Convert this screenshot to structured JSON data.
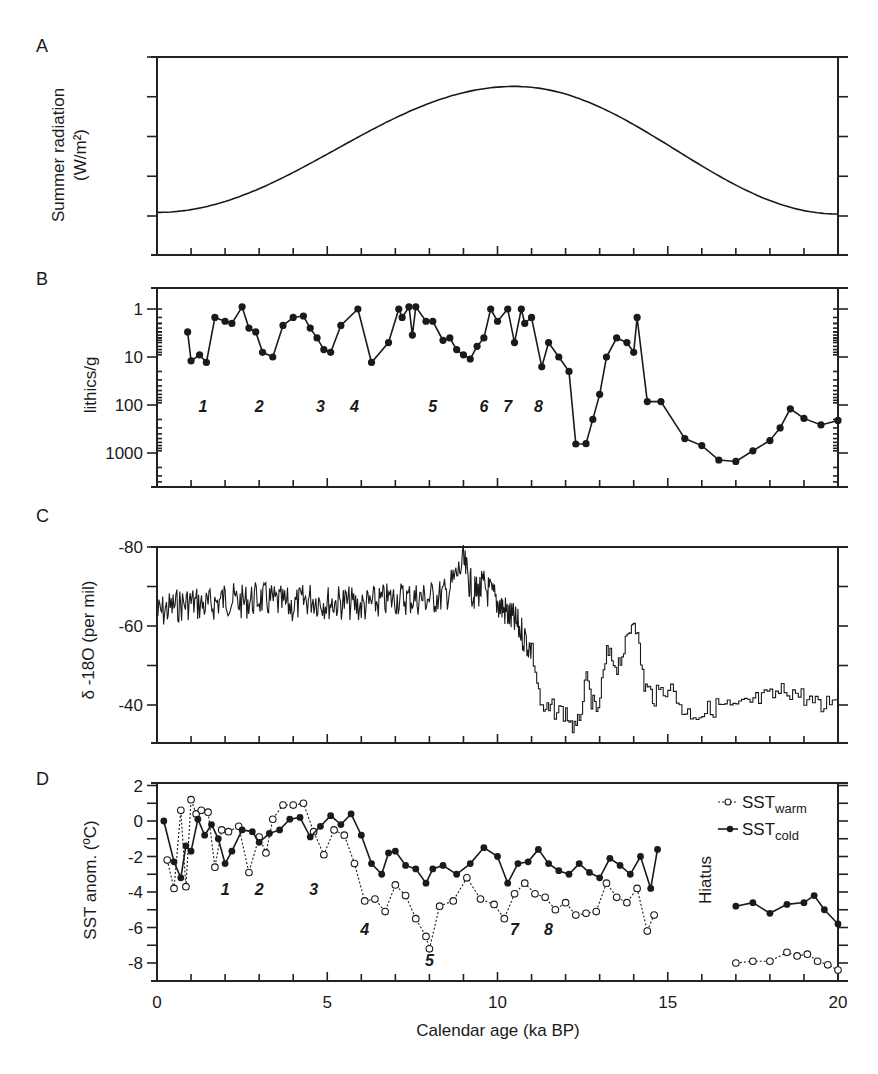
{
  "figure": {
    "xlabel": "Calendar age (ka BP)",
    "xticks": [
      "0",
      "5",
      "10",
      "15",
      "20"
    ]
  },
  "panels": {
    "A": {
      "letter": "A",
      "ylabel_line1": "Summer radiation",
      "ylabel_line2": "(W/m²)",
      "yticks": [
        "490",
        "470",
        "450"
      ]
    },
    "B": {
      "letter": "B",
      "ylabel": "lithics/g",
      "yticks": [
        "1",
        "10",
        "100",
        "1000"
      ],
      "events": [
        "1",
        "2",
        "3",
        "4",
        "5",
        "6",
        "7",
        "8"
      ]
    },
    "C": {
      "letter": "C",
      "ylabel": "δ -18O (per mil)",
      "yticks": [
        "-80",
        "-60",
        "-40"
      ]
    },
    "D": {
      "letter": "D",
      "ylabel": "SST anom. (ºC)",
      "yticks": [
        "2",
        "0",
        "-2",
        "-4",
        "-6",
        "-8"
      ],
      "events": [
        "1",
        "2",
        "3",
        "4",
        "5",
        "7",
        "8"
      ],
      "hiatus_label": "Hiatus",
      "legend": [
        {
          "name": "SST",
          "sub": "warm",
          "marker": "open-circle",
          "line": "dotted"
        },
        {
          "name": "SST",
          "sub": "cold",
          "marker": "filled-circle",
          "line": "solid"
        }
      ]
    }
  },
  "chart_data": [
    {
      "panel": "A",
      "type": "line",
      "title": "",
      "xlabel": "Calendar age (ka BP)",
      "ylabel": "Summer radiation (W/m2)",
      "xlim": [
        0,
        20
      ],
      "ylim": [
        440,
        490
      ],
      "x": [
        0,
        1,
        2,
        3,
        4,
        5,
        6,
        7,
        8,
        9,
        10,
        10.5,
        11,
        12,
        13,
        14,
        15,
        16,
        17,
        18,
        19,
        20
      ],
      "y": [
        451,
        452,
        454.5,
        458,
        462,
        466.5,
        471,
        475,
        478.5,
        481,
        482.5,
        482.6,
        482.3,
        480.5,
        477.5,
        473.5,
        469,
        464,
        459,
        454.5,
        451.5,
        450.5
      ]
    },
    {
      "panel": "B",
      "type": "line",
      "title": "",
      "ylabel": "lithics/g (log, inverted)",
      "xlim": [
        0,
        20
      ],
      "ylim": [
        3000,
        0.5
      ],
      "x": [
        0.9,
        1.0,
        1.25,
        1.45,
        1.7,
        2.0,
        2.2,
        2.5,
        2.7,
        2.9,
        3.1,
        3.4,
        3.7,
        4.0,
        4.3,
        4.5,
        4.7,
        4.9,
        5.1,
        5.4,
        5.9,
        6.3,
        6.8,
        7.1,
        7.2,
        7.4,
        7.5,
        7.6,
        7.9,
        8.1,
        8.4,
        8.6,
        8.8,
        9.0,
        9.2,
        9.4,
        9.6,
        9.8,
        10.0,
        10.3,
        10.5,
        10.7,
        10.8,
        11.0,
        11.3,
        11.5,
        11.8,
        12.1,
        12.3,
        12.6,
        12.8,
        13.0,
        13.2,
        13.5,
        13.8,
        14.0,
        14.1,
        14.4,
        14.8,
        15.5,
        16.0,
        16.5,
        17.0,
        17.5,
        18.0,
        18.3,
        18.6,
        19.0,
        19.5,
        20.0
      ],
      "y": [
        3,
        12,
        9,
        13,
        1.5,
        1.8,
        2,
        0.9,
        2.5,
        3,
        8,
        10,
        2.2,
        1.5,
        1.4,
        2.5,
        4,
        7,
        8,
        2.2,
        1,
        13,
        5,
        1,
        1.5,
        0.9,
        3.5,
        0.9,
        1.8,
        1.8,
        4.5,
        4,
        7,
        9,
        11,
        6,
        4,
        1,
        1.8,
        1,
        5,
        1,
        2,
        1.5,
        16,
        5,
        10,
        20,
        650,
        640,
        200,
        60,
        10,
        4,
        5,
        8,
        1.5,
        85,
        85,
        500,
        700,
        1400,
        1500,
        900,
        550,
        300,
        120,
        190,
        260,
        210
      ]
    },
    {
      "panel": "C",
      "type": "line",
      "title": "",
      "ylabel": "δ-18O (per mil)",
      "xlim": [
        0,
        20
      ],
      "ylim": [
        -30,
        -80
      ],
      "x": [
        0,
        0.5,
        1,
        1.5,
        2,
        2.5,
        3,
        3.5,
        4,
        4.5,
        5,
        5.5,
        6,
        6.5,
        7,
        7.5,
        8,
        8.5,
        9,
        9.3,
        9.6,
        10,
        10.3,
        10.6,
        11,
        11.3,
        11.6,
        12,
        12.3,
        12.6,
        12.9,
        13.2,
        13.5,
        13.8,
        14.0,
        14.3,
        14.6,
        15,
        15.5,
        16,
        16.5,
        17,
        17.5,
        18,
        18.5,
        19,
        19.5,
        20
      ],
      "y": [
        -63,
        -65,
        -66,
        -65,
        -67,
        -66,
        -67,
        -66,
        -65,
        -67,
        -66,
        -66,
        -65,
        -66,
        -67,
        -67,
        -67,
        -68,
        -76,
        -68,
        -70,
        -66,
        -63,
        -60,
        -54,
        -38,
        -39,
        -38,
        -33,
        -46,
        -37,
        -53,
        -50,
        -56,
        -63,
        -45,
        -42,
        -45,
        -38,
        -38,
        -40,
        -39,
        -41,
        -42,
        -44,
        -42,
        -39,
        -44
      ]
    },
    {
      "panel": "D",
      "type": "line",
      "title": "",
      "xlabel": "Calendar age (ka BP)",
      "ylabel": "SST anom. (ºC)",
      "xlim": [
        0,
        20
      ],
      "ylim": [
        -9,
        2
      ],
      "series": [
        {
          "name": "SST_cold",
          "marker": "filled",
          "x": [
            0.2,
            0.5,
            0.7,
            0.85,
            1.0,
            1.2,
            1.4,
            1.6,
            1.8,
            2.0,
            2.2,
            2.5,
            2.8,
            3.0,
            3.3,
            3.6,
            3.9,
            4.2,
            4.5,
            4.8,
            5.1,
            5.4,
            5.7,
            6.0,
            6.3,
            6.6,
            6.8,
            7.0,
            7.3,
            7.6,
            7.9,
            8.1,
            8.4,
            8.8,
            9.2,
            9.6,
            10.0,
            10.3,
            10.6,
            10.9,
            11.2,
            11.5,
            11.8,
            12.1,
            12.4,
            12.7,
            13.0,
            13.3,
            13.6,
            13.9,
            14.2,
            14.5,
            14.7,
            17.0,
            17.5,
            18.0,
            18.5,
            19.0,
            19.3,
            19.6,
            20.0
          ],
          "y": [
            0,
            -2.3,
            -3.2,
            -1.4,
            -1.7,
            0.1,
            -0.8,
            -0.2,
            -1.0,
            -2.4,
            -1.7,
            -0.5,
            -0.6,
            -1.2,
            -0.7,
            -0.5,
            0.1,
            0.2,
            -0.9,
            -0.3,
            0.3,
            -0.2,
            0.4,
            -0.8,
            -2.4,
            -3.0,
            -1.8,
            -1.7,
            -2.5,
            -2.7,
            -3.5,
            -2.7,
            -2.5,
            -3.0,
            -2.4,
            -1.5,
            -2.0,
            -3.5,
            -2.4,
            -2.3,
            -1.6,
            -2.4,
            -2.8,
            -3.0,
            -2.4,
            -2.9,
            -3.2,
            -2.1,
            -2.5,
            -3.0,
            -2.0,
            -3.8,
            -1.6,
            -4.8,
            -4.6,
            -5.2,
            -4.7,
            -4.6,
            -4.2,
            -5.0,
            -5.8
          ]
        },
        {
          "name": "SST_warm",
          "marker": "open",
          "x": [
            0.3,
            0.5,
            0.7,
            0.85,
            1.0,
            1.15,
            1.3,
            1.5,
            1.7,
            1.9,
            2.1,
            2.4,
            2.7,
            3.0,
            3.2,
            3.4,
            3.7,
            4.0,
            4.3,
            4.6,
            4.9,
            5.2,
            5.5,
            5.8,
            6.1,
            6.4,
            6.7,
            7.0,
            7.3,
            7.6,
            7.9,
            8.0,
            8.3,
            8.7,
            9.1,
            9.5,
            9.9,
            10.2,
            10.5,
            10.8,
            11.1,
            11.4,
            11.7,
            12.0,
            12.3,
            12.6,
            12.9,
            13.2,
            13.5,
            13.8,
            14.1,
            14.4,
            14.6,
            17.0,
            17.5,
            18.0,
            18.5,
            18.8,
            19.1,
            19.4,
            19.7,
            20.0
          ],
          "y": [
            -2.2,
            -3.8,
            0.6,
            -3.7,
            1.2,
            0.4,
            0.6,
            0.5,
            -2.6,
            -0.5,
            -0.6,
            -0.3,
            -2.9,
            -0.9,
            -1.8,
            0.1,
            0.9,
            0.9,
            1.0,
            -0.6,
            -1.9,
            -0.5,
            -0.8,
            -2.4,
            -4.5,
            -4.4,
            -5.1,
            -3.6,
            -4.2,
            -5.5,
            -6.5,
            -7.2,
            -4.8,
            -4.5,
            -3.2,
            -4.4,
            -4.7,
            -5.5,
            -4.1,
            -3.5,
            -4.1,
            -4.3,
            -5.0,
            -4.6,
            -5.3,
            -5.2,
            -5.1,
            -3.5,
            -4.3,
            -4.6,
            -3.8,
            -6.2,
            -5.3,
            -8.0,
            -7.9,
            -7.9,
            -7.4,
            -7.6,
            -7.5,
            -7.9,
            -8.1,
            -8.4
          ]
        }
      ],
      "legend_position": "upper right",
      "annotations": [
        "Hiatus (~15-17 ka)"
      ]
    }
  ]
}
